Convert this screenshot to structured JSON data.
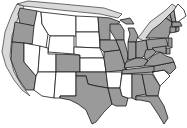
{
  "map": {
    "title": "",
    "type": "choropleth",
    "region": "United States (contiguous)",
    "colors": {
      "shaded": "#9a9a9a",
      "unshaded": "#ffffff",
      "halo": "#d9d9d9",
      "border": "#1a1a1a"
    },
    "legend": [],
    "states": [
      {
        "id": "WA",
        "category": "shaded"
      },
      {
        "id": "OR",
        "category": "shaded"
      },
      {
        "id": "CA",
        "category": "shaded"
      },
      {
        "id": "ID",
        "category": "unshaded"
      },
      {
        "id": "NV",
        "category": "unshaded"
      },
      {
        "id": "MT",
        "category": "unshaded"
      },
      {
        "id": "WY",
        "category": "unshaded"
      },
      {
        "id": "UT",
        "category": "unshaded"
      },
      {
        "id": "AZ",
        "category": "unshaded"
      },
      {
        "id": "CO",
        "category": "shaded"
      },
      {
        "id": "NM",
        "category": "unshaded"
      },
      {
        "id": "ND",
        "category": "unshaded"
      },
      {
        "id": "SD",
        "category": "unshaded"
      },
      {
        "id": "NE",
        "category": "unshaded"
      },
      {
        "id": "KS",
        "category": "unshaded"
      },
      {
        "id": "OK",
        "category": "shaded"
      },
      {
        "id": "TX",
        "category": "shaded"
      },
      {
        "id": "MN",
        "category": "shaded"
      },
      {
        "id": "IA",
        "category": "shaded"
      },
      {
        "id": "MO",
        "category": "shaded"
      },
      {
        "id": "AR",
        "category": "unshaded"
      },
      {
        "id": "LA",
        "category": "shaded"
      },
      {
        "id": "WI",
        "category": "shaded"
      },
      {
        "id": "IL",
        "category": "shaded"
      },
      {
        "id": "MI",
        "category": "shaded"
      },
      {
        "id": "IN",
        "category": "shaded"
      },
      {
        "id": "OH",
        "category": "shaded"
      },
      {
        "id": "KY",
        "category": "shaded"
      },
      {
        "id": "TN",
        "category": "shaded"
      },
      {
        "id": "MS",
        "category": "unshaded"
      },
      {
        "id": "AL",
        "category": "shaded"
      },
      {
        "id": "GA",
        "category": "shaded"
      },
      {
        "id": "FL",
        "category": "shaded"
      },
      {
        "id": "SC",
        "category": "unshaded"
      },
      {
        "id": "NC",
        "category": "shaded"
      },
      {
        "id": "VA",
        "category": "shaded"
      },
      {
        "id": "WV",
        "category": "shaded"
      },
      {
        "id": "PA",
        "category": "shaded"
      },
      {
        "id": "NY",
        "category": "shaded"
      },
      {
        "id": "VT",
        "category": "shaded"
      },
      {
        "id": "NH",
        "category": "shaded"
      },
      {
        "id": "ME",
        "category": "unshaded"
      },
      {
        "id": "MA",
        "category": "shaded"
      },
      {
        "id": "CT",
        "category": "shaded"
      },
      {
        "id": "RI",
        "category": "shaded"
      },
      {
        "id": "NJ",
        "category": "shaded"
      },
      {
        "id": "DE",
        "category": "shaded"
      },
      {
        "id": "MD",
        "category": "shaded"
      }
    ]
  }
}
